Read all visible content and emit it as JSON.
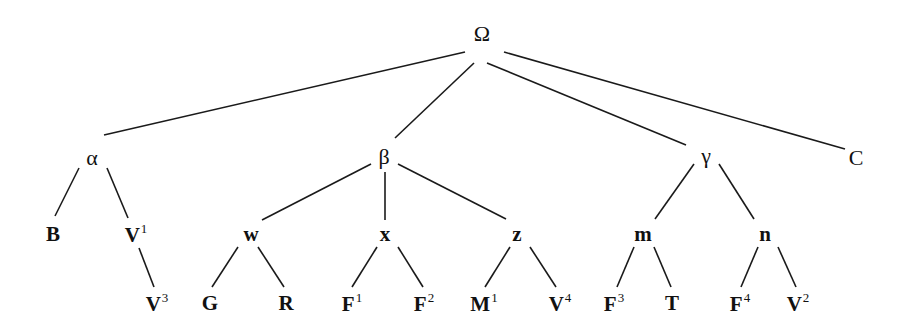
{
  "tree": {
    "root": "Ω",
    "nodes": [
      {
        "id": "omega",
        "label": "Ω",
        "sup": "",
        "x": 482,
        "y": 34,
        "style": "greek"
      },
      {
        "id": "alpha",
        "label": "α",
        "sup": "",
        "x": 92,
        "y": 158,
        "style": "greek"
      },
      {
        "id": "beta",
        "label": "β",
        "sup": "",
        "x": 384,
        "y": 157,
        "style": "greek"
      },
      {
        "id": "gamma",
        "label": "γ",
        "sup": "",
        "x": 706,
        "y": 156,
        "style": "greek"
      },
      {
        "id": "C",
        "label": "C",
        "sup": "",
        "x": 856,
        "y": 158,
        "style": "greek"
      },
      {
        "id": "B",
        "label": "B",
        "sup": "",
        "x": 53,
        "y": 234,
        "style": "bold"
      },
      {
        "id": "V1",
        "label": "V",
        "sup": "1",
        "x": 136,
        "y": 234,
        "style": "bold"
      },
      {
        "id": "V3",
        "label": "V",
        "sup": "3",
        "x": 157,
        "y": 303,
        "style": "bold"
      },
      {
        "id": "w",
        "label": "w",
        "sup": "",
        "x": 251,
        "y": 234,
        "style": "bold"
      },
      {
        "id": "x",
        "label": "x",
        "sup": "",
        "x": 385,
        "y": 234,
        "style": "bold"
      },
      {
        "id": "z",
        "label": "z",
        "sup": "",
        "x": 517,
        "y": 234,
        "style": "bold"
      },
      {
        "id": "m",
        "label": "m",
        "sup": "",
        "x": 643,
        "y": 234,
        "style": "bold"
      },
      {
        "id": "n",
        "label": "n",
        "sup": "",
        "x": 765,
        "y": 234,
        "style": "bold"
      },
      {
        "id": "G",
        "label": "G",
        "sup": "",
        "x": 210,
        "y": 303,
        "style": "bold"
      },
      {
        "id": "R",
        "label": "R",
        "sup": "",
        "x": 286,
        "y": 303,
        "style": "bold"
      },
      {
        "id": "F1",
        "label": "F",
        "sup": "1",
        "x": 352,
        "y": 303,
        "style": "bold"
      },
      {
        "id": "F2",
        "label": "F",
        "sup": "2",
        "x": 424,
        "y": 303,
        "style": "bold"
      },
      {
        "id": "M1",
        "label": "M",
        "sup": "1",
        "x": 484,
        "y": 303,
        "style": "bold"
      },
      {
        "id": "V4",
        "label": "V",
        "sup": "4",
        "x": 560,
        "y": 303,
        "style": "bold"
      },
      {
        "id": "F3",
        "label": "F",
        "sup": "3",
        "x": 614,
        "y": 303,
        "style": "bold"
      },
      {
        "id": "T",
        "label": "T",
        "sup": "",
        "x": 672,
        "y": 303,
        "style": "bold"
      },
      {
        "id": "F4",
        "label": "F",
        "sup": "4",
        "x": 740,
        "y": 303,
        "style": "bold"
      },
      {
        "id": "V2",
        "label": "V",
        "sup": "2",
        "x": 798,
        "y": 303,
        "style": "bold"
      }
    ],
    "edges": [
      {
        "from": "omega",
        "to": "alpha",
        "x1": 465,
        "y1": 52,
        "x2": 104,
        "y2": 135
      },
      {
        "from": "omega",
        "to": "beta",
        "x1": 474,
        "y1": 63,
        "x2": 395,
        "y2": 138
      },
      {
        "from": "omega",
        "to": "gamma",
        "x1": 487,
        "y1": 63,
        "x2": 686,
        "y2": 145
      },
      {
        "from": "omega",
        "to": "C",
        "x1": 504,
        "y1": 52,
        "x2": 845,
        "y2": 149
      },
      {
        "from": "alpha",
        "to": "B",
        "x1": 79,
        "y1": 168,
        "x2": 55,
        "y2": 216
      },
      {
        "from": "alpha",
        "to": "V1",
        "x1": 107,
        "y1": 168,
        "x2": 128,
        "y2": 218
      },
      {
        "from": "V1",
        "to": "V3",
        "x1": 139,
        "y1": 248,
        "x2": 154,
        "y2": 287
      },
      {
        "from": "beta",
        "to": "w",
        "x1": 371,
        "y1": 164,
        "x2": 262,
        "y2": 220
      },
      {
        "from": "beta",
        "to": "x",
        "x1": 385,
        "y1": 172,
        "x2": 385,
        "y2": 220
      },
      {
        "from": "beta",
        "to": "z",
        "x1": 398,
        "y1": 164,
        "x2": 506,
        "y2": 219
      },
      {
        "from": "w",
        "to": "G",
        "x1": 238,
        "y1": 247,
        "x2": 212,
        "y2": 287
      },
      {
        "from": "w",
        "to": "R",
        "x1": 258,
        "y1": 247,
        "x2": 284,
        "y2": 287
      },
      {
        "from": "x",
        "to": "F1",
        "x1": 377,
        "y1": 247,
        "x2": 352,
        "y2": 287
      },
      {
        "from": "x",
        "to": "F2",
        "x1": 398,
        "y1": 247,
        "x2": 423,
        "y2": 287
      },
      {
        "from": "gamma",
        "to": "m",
        "x1": 694,
        "y1": 164,
        "x2": 655,
        "y2": 219
      },
      {
        "from": "gamma",
        "to": "n",
        "x1": 719,
        "y1": 164,
        "x2": 754,
        "y2": 219
      },
      {
        "from": "z",
        "to": "M1",
        "x1": 510,
        "y1": 247,
        "x2": 485,
        "y2": 287
      },
      {
        "from": "z",
        "to": "V4",
        "x1": 530,
        "y1": 247,
        "x2": 556,
        "y2": 287
      },
      {
        "from": "m",
        "to": "F3",
        "x1": 634,
        "y1": 247,
        "x2": 617,
        "y2": 287
      },
      {
        "from": "m",
        "to": "T",
        "x1": 654,
        "y1": 247,
        "x2": 671,
        "y2": 287
      },
      {
        "from": "n",
        "to": "F4",
        "x1": 758,
        "y1": 247,
        "x2": 741,
        "y2": 287
      },
      {
        "from": "n",
        "to": "V2",
        "x1": 778,
        "y1": 247,
        "x2": 796,
        "y2": 287
      }
    ]
  },
  "colors": {
    "background": "#ffffff",
    "ink": "#111111"
  }
}
